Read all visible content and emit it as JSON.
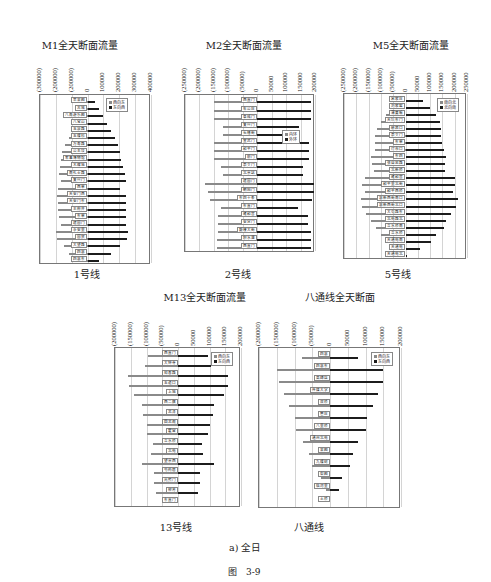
{
  "figure": {
    "subfigure_caption": "a) 全日",
    "figure_caption": "图　3-9"
  },
  "colors": {
    "negative_series": "#8a8a8a",
    "positive_series": "#1c1c1c",
    "grid": "#d4d4d4",
    "frame": "#777777"
  },
  "chart_data": [
    {
      "id": "m1",
      "type": "bar",
      "orientation": "horizontal-diverging",
      "title": "M1全天断面流量",
      "caption": "1号线",
      "xlim": [
        -300000,
        400000
      ],
      "ticks": [
        -300000,
        -200000,
        -100000,
        0,
        100000,
        200000,
        300000,
        400000
      ],
      "tick_labels": [
        "(300000)",
        "(200000)",
        "(200000)",
        "0",
        "100000",
        "200000",
        "300000",
        "400000"
      ],
      "grid": true,
      "legend_position": "upper-right",
      "series": [
        {
          "name": "西向东",
          "color": "#8a8a8a"
        },
        {
          "name": "东向西",
          "color": "#1c1c1c"
        }
      ],
      "categories": [
        "苹果园",
        "古城",
        "八角游乐园",
        "八宝山",
        "玉泉路",
        "五棵松",
        "万寿路",
        "公主坟",
        "军事博物馆",
        "木樨地",
        "南礼士路",
        "复兴门",
        "西单",
        "天安门西",
        "天安门东",
        "王府井",
        "东单",
        "建国门",
        "永安里",
        "国贸",
        "大望路",
        "四惠",
        "四惠东"
      ],
      "values_neg": [
        -10000,
        -35000,
        -60000,
        -85000,
        -100000,
        -120000,
        -140000,
        -160000,
        -170000,
        -175000,
        -180000,
        -170000,
        -185000,
        -190000,
        -185000,
        -185000,
        -180000,
        -170000,
        -200000,
        -190000,
        -150000,
        -120000,
        -60000
      ],
      "values_pos": [
        45000,
        70000,
        95000,
        120000,
        150000,
        175000,
        195000,
        205000,
        210000,
        225000,
        235000,
        245000,
        205000,
        240000,
        240000,
        245000,
        240000,
        240000,
        255000,
        250000,
        205000,
        150000,
        75000
      ]
    },
    {
      "id": "m2",
      "type": "bar",
      "orientation": "horizontal-diverging",
      "title": "M2全天断面流量",
      "caption": "2号线",
      "xlim": [
        -250000,
        200000
      ],
      "ticks": [
        -250000,
        -200000,
        -150000,
        -100000,
        -50000,
        0,
        50000,
        100000,
        150000,
        200000
      ],
      "tick_labels": [
        "(250000)",
        "(200000)",
        "(150000)",
        "(100000)",
        "(50000)",
        "0",
        "50000",
        "100000",
        "150000",
        "200000"
      ],
      "grid": true,
      "legend_position": "right",
      "series": [
        {
          "name": "内环",
          "color": "#8a8a8a"
        },
        {
          "name": "外环",
          "color": "#1c1c1c"
        }
      ],
      "categories": [
        "西直门",
        "车公庄",
        "阜成门",
        "复兴门",
        "长椿街",
        "宣武门",
        "和平门",
        "前门",
        "崇文门",
        "北京站",
        "建国门",
        "朝阳门",
        "东四十条",
        "东直门",
        "雍和宫",
        "安定门",
        "鼓楼大街",
        "积水潭",
        "西直门"
      ],
      "values_neg": [
        -150000,
        -150000,
        -150000,
        -120000,
        -120000,
        -150000,
        -150000,
        -150000,
        -125000,
        -120000,
        -180000,
        -170000,
        -165000,
        -125000,
        -135000,
        -135000,
        -135000,
        -140000,
        -140000
      ],
      "values_pos": [
        185000,
        185000,
        185000,
        145000,
        145000,
        180000,
        180000,
        180000,
        160000,
        160000,
        195000,
        195000,
        190000,
        140000,
        175000,
        175000,
        185000,
        185000,
        185000
      ]
    },
    {
      "id": "m5",
      "type": "bar",
      "orientation": "horizontal-diverging",
      "title": "M5全天断面流量",
      "caption": "5号线",
      "xlim": [
        -250000,
        250000
      ],
      "ticks": [
        -250000,
        -200000,
        -150000,
        -100000,
        -50000,
        0,
        50000,
        100000,
        150000,
        200000,
        250000
      ],
      "tick_labels": [
        "(250000)",
        "(200000)",
        "(150000)",
        "(100000)",
        "(50000)",
        "0",
        "50000",
        "100000",
        "150000",
        "200000",
        "250000"
      ],
      "grid": true,
      "legend_position": "upper-right",
      "series": [
        {
          "name": "南向北",
          "color": "#8a8a8a"
        },
        {
          "name": "北向南",
          "color": "#1c1c1c"
        }
      ],
      "categories": [
        "宋家庄",
        "刘家窑",
        "蒲黄榆",
        "天坛东门",
        "磁器口",
        "崇文门",
        "东单",
        "灯市口",
        "东四",
        "张自忠路",
        "北新桥",
        "雍和宫",
        "和平里北街",
        "和平西桥",
        "惠新西街南口",
        "惠新西街北口",
        "大屯路东",
        "北苑路北",
        "立水桥南",
        "立水桥",
        "天通苑南",
        "天通苑",
        "天通苑北"
      ],
      "values_neg": [
        -10000,
        -55000,
        -80000,
        -100000,
        -115000,
        -125000,
        -125000,
        -125000,
        -140000,
        -135000,
        -130000,
        -165000,
        -175000,
        -165000,
        -180000,
        -175000,
        -160000,
        -140000,
        -120000,
        -100000,
        -80000,
        -40000,
        -10000
      ],
      "values_pos": [
        70000,
        100000,
        125000,
        140000,
        145000,
        145000,
        150000,
        155000,
        165000,
        160000,
        160000,
        200000,
        200000,
        195000,
        215000,
        205000,
        185000,
        165000,
        155000,
        125000,
        105000,
        60000,
        5000
      ]
    },
    {
      "id": "m13",
      "type": "bar",
      "orientation": "horizontal-diverging",
      "title": "M13全天断面流量",
      "caption": "13号线",
      "xlim": [
        -200000,
        200000
      ],
      "ticks": [
        -200000,
        -150000,
        -100000,
        -50000,
        0,
        50000,
        100000,
        150000,
        200000
      ],
      "tick_labels": [
        "(200000)",
        "(150000)",
        "(100000)",
        "(50000)",
        "0",
        "50000",
        "100000",
        "150000",
        "200000"
      ],
      "grid": true,
      "legend_position": "upper-right",
      "series": [
        {
          "name": "西向东",
          "color": "#8a8a8a"
        },
        {
          "name": "东向西",
          "color": "#1c1c1c"
        }
      ],
      "categories": [
        "西直门",
        "大钟寺",
        "知春路",
        "五道口",
        "上地",
        "西二旗",
        "龙泽",
        "回龙观",
        "霍营",
        "立水桥",
        "北苑",
        "望京西",
        "芍药居",
        "光熙门",
        "柳芳",
        "东直门"
      ],
      "values_neg": [
        -95000,
        -105000,
        -160000,
        -155000,
        -140000,
        -115000,
        -110000,
        -100000,
        -100000,
        -80000,
        -85000,
        -115000,
        -75000,
        -75000,
        -70000,
        0
      ],
      "values_pos": [
        95000,
        105000,
        160000,
        160000,
        145000,
        115000,
        110000,
        100000,
        95000,
        75000,
        80000,
        115000,
        70000,
        70000,
        65000,
        0
      ]
    },
    {
      "id": "batong",
      "type": "bar",
      "orientation": "horizontal-diverging",
      "title": "八通线全天断面",
      "caption": "八通线",
      "xlim": [
        -200000,
        200000
      ],
      "ticks": [
        -200000,
        -150000,
        -100000,
        -50000,
        0,
        50000,
        100000,
        150000,
        200000
      ],
      "tick_labels": [
        "(200000)",
        "(150000)",
        "(100000)",
        "(50000)",
        "0",
        "50000",
        "100000",
        "150000",
        "200000"
      ],
      "grid": true,
      "legend_position": "upper-right",
      "series": [
        {
          "name": "西向东",
          "color": "#8a8a8a"
        },
        {
          "name": "东向西",
          "color": "#1c1c1c"
        }
      ],
      "categories": [
        "四惠",
        "四惠东",
        "高碑店",
        "传媒大学",
        "双桥",
        "管庄",
        "八里桥",
        "通州北苑",
        "果园",
        "九棵树",
        "梨园",
        "临河里",
        "土桥"
      ],
      "values_neg": [
        -80000,
        -150000,
        -145000,
        -130000,
        -115000,
        -100000,
        -95000,
        -75000,
        -60000,
        -50000,
        -25000,
        -10000,
        0
      ],
      "values_pos": [
        80000,
        150000,
        150000,
        135000,
        120000,
        105000,
        100000,
        80000,
        65000,
        55000,
        35000,
        25000,
        0
      ]
    }
  ]
}
